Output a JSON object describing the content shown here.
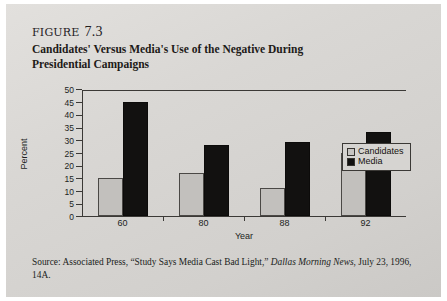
{
  "figure": {
    "label": "figure",
    "number": "7.3",
    "title": "Candidates' Versus Media's Use of the Negative During Presidential Campaigns"
  },
  "source": {
    "prefix": "Source: Associated Press, “Study Says Media Cast Bad Light,” ",
    "publication": "Dallas Morning News",
    "suffix": ", July 23, 1996, 14A."
  },
  "legend": {
    "position": "right-inside",
    "items": [
      {
        "label": "Candidates",
        "color": "#c7c5c2"
      },
      {
        "label": "Media",
        "color": "#121110"
      }
    ]
  },
  "chart_data": {
    "type": "bar",
    "title": "Candidates' Versus Media's Use of the Negative During Presidential Campaigns",
    "categories": [
      "60",
      "80",
      "88",
      "92"
    ],
    "series": [
      {
        "name": "Candidates",
        "values": [
          15,
          17,
          11,
          25
        ],
        "color": "#c2c0bd"
      },
      {
        "name": "Media",
        "values": [
          45,
          28,
          29,
          33
        ],
        "color": "#121110"
      }
    ],
    "xlabel": "Year",
    "ylabel": "Percent",
    "ylim": [
      0,
      50
    ],
    "ytick_step": 5,
    "yticks": [
      0,
      5,
      10,
      15,
      20,
      25,
      30,
      35,
      40,
      45,
      50
    ],
    "grid": false,
    "legend_position": "right-inside"
  }
}
